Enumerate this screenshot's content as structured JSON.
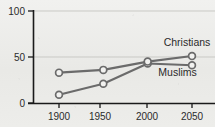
{
  "chart_data": {
    "type": "line",
    "title": "",
    "subtitle": "",
    "xlabel": "",
    "ylabel": "",
    "x": [
      1900,
      1950,
      2000,
      2050
    ],
    "categories": [
      "1900",
      "1950",
      "2000",
      "2050"
    ],
    "xlim": [
      1885,
      2065
    ],
    "ylim": [
      0,
      100
    ],
    "yticks": [
      0,
      50,
      100
    ],
    "ytick_labels": [
      "0",
      "50",
      "100"
    ],
    "xtick_labels": [
      "1900",
      "1950",
      "2000",
      "2050"
    ],
    "grid": "horizontal",
    "legend_position": "inline-annotation",
    "series": [
      {
        "name": "Christians",
        "values": [
          33,
          36,
          45,
          51
        ],
        "color": "#6b6b6b",
        "marker": "open-circle",
        "label_x": 2018,
        "label_y": 62
      },
      {
        "name": "Muslims",
        "values": [
          9,
          21,
          43,
          41
        ],
        "color": "#6b6b6b",
        "marker": "open-circle",
        "label_x": 2012,
        "label_y": 29
      }
    ],
    "annotations": [
      {
        "text": "Christians",
        "series": "Christians"
      },
      {
        "text": "Muslims",
        "series": "Muslims"
      }
    ],
    "colors": {
      "background": "#ecece9",
      "line": "#6b6b6b",
      "marker_fill": "#f2f2f0",
      "axis": "#1a1a1a",
      "grid": "#c9c9c5",
      "text": "#2b2b2b"
    }
  },
  "axis": {
    "y_tick_0": "0",
    "y_tick_50": "50",
    "y_tick_100": "100",
    "x_tick_1900": "1900",
    "x_tick_1950": "1950",
    "x_tick_2000": "2000",
    "x_tick_2050": "2050"
  },
  "labels": {
    "christians": "Christians",
    "muslims": "Muslims"
  }
}
